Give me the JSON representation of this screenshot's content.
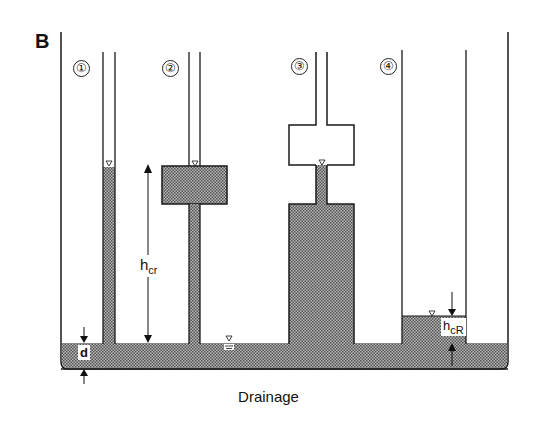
{
  "panel_label": "B",
  "caption": "Drainage",
  "columns": [
    {
      "id": "1",
      "label": "①",
      "type": "capillary-tube"
    },
    {
      "id": "2",
      "label": "②",
      "type": "tube-with-upper-reservoir"
    },
    {
      "id": "3",
      "label": "③",
      "type": "tube-with-lower-reservoir-and-empty-upper-chamber"
    },
    {
      "id": "4",
      "label": "④",
      "type": "wide-tube"
    }
  ],
  "annotations": {
    "critical_height": {
      "base": "h",
      "sub": "cr"
    },
    "bath_depth": "d",
    "critical_height_reservoir": {
      "base": "h",
      "sub": "cR"
    }
  },
  "colors": {
    "line": "#1a1a1a",
    "water_fill": "#8c8c8c",
    "background": "#ffffff"
  }
}
